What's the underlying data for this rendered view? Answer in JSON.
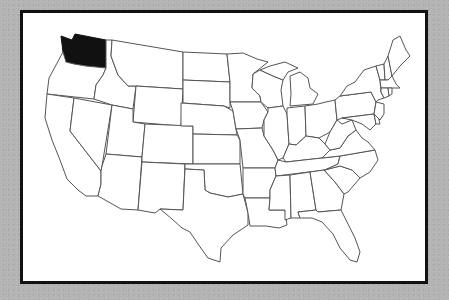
{
  "map": {
    "subject": "United States",
    "highlighted_state": "Washington",
    "highlight_color": "#111111",
    "state_fill": "#ffffff",
    "border_color": "#555555",
    "frame_border_color": "#111111",
    "background_color": "#b4b4b4"
  }
}
